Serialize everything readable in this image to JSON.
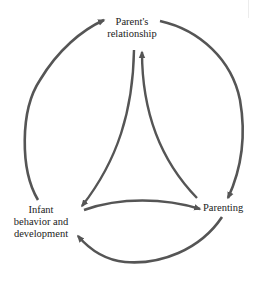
{
  "diagram": {
    "type": "cyclic-relationship-diagram",
    "colors": {
      "arrow": "#555555",
      "text": "#222222",
      "background": "#ffffff"
    },
    "nodes": [
      {
        "id": "parents_relationship",
        "label_lines": [
          "Parent's",
          "relationship"
        ]
      },
      {
        "id": "infant",
        "label_lines": [
          "Infant",
          "behavior and",
          "development"
        ]
      },
      {
        "id": "parenting",
        "label_lines": [
          "Parenting"
        ]
      }
    ],
    "edges": [
      {
        "from": "infant",
        "to": "parents_relationship",
        "style": "outer-arc"
      },
      {
        "from": "parents_relationship",
        "to": "parenting",
        "style": "outer-arc"
      },
      {
        "from": "parenting",
        "to": "infant",
        "style": "outer-arc"
      },
      {
        "from": "parents_relationship",
        "to": "infant",
        "style": "inner-curve"
      },
      {
        "from": "infant",
        "to": "parenting",
        "style": "inner-curve"
      },
      {
        "from": "parenting",
        "to": "parents_relationship",
        "style": "inner-curve"
      }
    ]
  }
}
